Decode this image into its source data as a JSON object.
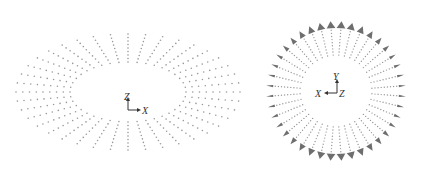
{
  "figure": {
    "panels": [
      {
        "id": "perspective-view",
        "center": [
          128,
          92
        ],
        "outer_radius": [
          112,
          58
        ],
        "inner_radius": [
          58,
          30
        ],
        "line_count": 40,
        "dots_per_line": 9,
        "axes": {
          "vertical": "Z",
          "horizontal": "X"
        }
      },
      {
        "id": "top-view",
        "center": [
          336,
          91
        ],
        "outer_radius": 70,
        "inner_radius": 36,
        "line_count": 40,
        "dots_per_line": 10,
        "axes": {
          "vertical": "Y",
          "horizontal": "X",
          "out_of_plane": "Z"
        }
      }
    ],
    "colors": {
      "dot": "#9a9a9a",
      "marker": "#6e6e6e",
      "axis": "#333333"
    }
  }
}
